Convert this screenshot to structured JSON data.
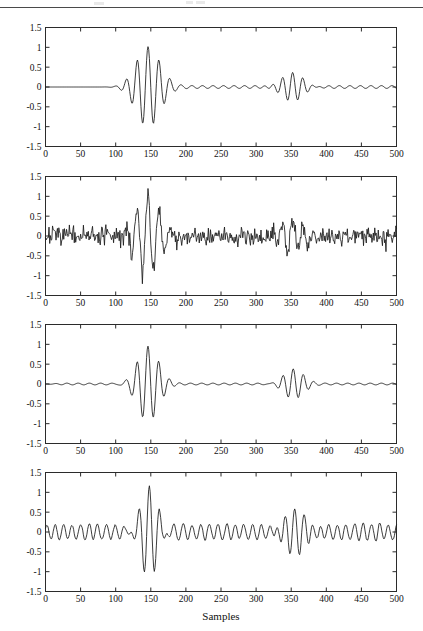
{
  "figure": {
    "background": "#ffffff",
    "line_color": "#1a1a1a",
    "axis_color": "#2b2b2b",
    "tick_font_size": 9.5,
    "label_font_size": 11
  },
  "axis": {
    "xlabel": "Samples",
    "xlim": [
      0,
      500
    ],
    "ylim": [
      -1.5,
      1.5
    ],
    "xticks": [
      0,
      50,
      100,
      150,
      200,
      250,
      300,
      350,
      400,
      450,
      500
    ],
    "xticklabels": [
      "0",
      "50",
      "100",
      "150",
      "200",
      "250",
      "300",
      "350",
      "400",
      "450",
      "500"
    ],
    "yticks": [
      1.5,
      1,
      0.5,
      0,
      -0.5,
      -1,
      -1.5
    ],
    "yticklabels": [
      "1.5",
      "1",
      "0.5",
      "0",
      "-0.5",
      "-1",
      "-1.5"
    ],
    "grid": false,
    "tick_direction": "in",
    "box": true
  },
  "chart_data": [
    {
      "type": "line",
      "title": "",
      "subplot_index": 1,
      "name": "original-clean-signal",
      "xlabel": "",
      "ylabel": "",
      "xlim": [
        0,
        500
      ],
      "ylim": [
        -1.5,
        1.5
      ],
      "xticks": [
        0,
        50,
        100,
        150,
        200,
        250,
        300,
        350,
        400,
        450,
        500
      ],
      "yticks": [
        -1.5,
        -1,
        -0.5,
        0,
        0.5,
        1,
        1.5
      ],
      "grid": false,
      "series": [
        {
          "name": "clean signal",
          "color": "#1a1a1a",
          "description": "Two Gaussian-modulated sinusoidal wave packets on a near-zero baseline with faint low-amplitude ripple between them.",
          "components": [
            {
              "kind": "gaussian-burst",
              "center": 146,
              "sigma": 17,
              "amplitude": 1.0,
              "period": 15.5,
              "phase": 0.0
            },
            {
              "kind": "gaussian-burst",
              "center": 352,
              "sigma": 16,
              "amplitude": 0.4,
              "period": 14.5,
              "phase": 0.0
            },
            {
              "kind": "ripple",
              "from": 100,
              "to": 500,
              "amplitude": 0.035,
              "period": 15.0
            }
          ],
          "peaks": [
            {
              "x": 117,
              "y": 0.3
            },
            {
              "x": 124,
              "y": -0.33
            },
            {
              "x": 131,
              "y": 0.82
            },
            {
              "x": 139,
              "y": -0.97
            },
            {
              "x": 146,
              "y": 1.0
            },
            {
              "x": 154,
              "y": -0.88
            },
            {
              "x": 161,
              "y": 0.7
            },
            {
              "x": 169,
              "y": -0.45
            },
            {
              "x": 177,
              "y": 0.22
            },
            {
              "x": 184,
              "y": -0.12
            },
            {
              "x": 331,
              "y": 0.28
            },
            {
              "x": 338,
              "y": -0.28
            },
            {
              "x": 345,
              "y": 0.33
            },
            {
              "x": 352,
              "y": -0.4
            },
            {
              "x": 359,
              "y": 0.38
            },
            {
              "x": 366,
              "y": -0.3
            },
            {
              "x": 374,
              "y": 0.18
            },
            {
              "x": 381,
              "y": -0.1
            }
          ]
        }
      ]
    },
    {
      "type": "line",
      "title": "",
      "subplot_index": 2,
      "name": "noisy-signal",
      "xlabel": "",
      "ylabel": "",
      "xlim": [
        0,
        500
      ],
      "ylim": [
        -1.5,
        1.5
      ],
      "xticks": [
        0,
        50,
        100,
        150,
        200,
        250,
        300,
        350,
        400,
        450,
        500
      ],
      "yticks": [
        -1.5,
        -1,
        -0.5,
        0,
        0.5,
        1,
        1.5
      ],
      "grid": false,
      "series": [
        {
          "name": "signal + white gaussian noise",
          "color": "#1a1a1a",
          "description": "Same signal buried in broadband white noise of roughly +/-0.3 amplitude across the whole record; main packet still visible at 120-175 reaching +/-1.1.",
          "components": [
            {
              "kind": "gaussian-burst",
              "center": 146,
              "sigma": 17,
              "amplitude": 1.0,
              "period": 15.5,
              "phase": 0.0
            },
            {
              "kind": "gaussian-burst",
              "center": 352,
              "sigma": 16,
              "amplitude": 0.4,
              "period": 14.5,
              "phase": 0.0
            },
            {
              "kind": "white-noise",
              "from": 0,
              "to": 500,
              "std": 0.2,
              "peak": 0.55,
              "seed": 7
            }
          ],
          "noise_std": 0.2,
          "max_value": 1.12,
          "min_value": -1.15
        }
      ]
    },
    {
      "type": "line",
      "title": "",
      "subplot_index": 3,
      "name": "denoised-signal-hard-threshold",
      "xlabel": "",
      "ylabel": "",
      "xlim": [
        0,
        500
      ],
      "ylim": [
        -1.5,
        1.5
      ],
      "xticks": [
        0,
        50,
        100,
        150,
        200,
        250,
        300,
        350,
        400,
        450,
        500
      ],
      "yticks": [
        -1.5,
        -1,
        -0.5,
        0,
        0.5,
        1,
        1.5
      ],
      "grid": false,
      "series": [
        {
          "name": "denoised signal",
          "color": "#1a1a1a",
          "description": "Reconstructed signal: noise almost fully suppressed to a flat baseline; both wave packets recovered with slight amplitude distortion and abrupt truncation near sample 180.",
          "components": [
            {
              "kind": "gaussian-burst",
              "center": 146,
              "sigma": 15,
              "amplitude": 0.95,
              "period": 15.5,
              "phase": 0.0
            },
            {
              "kind": "gaussian-burst",
              "center": 353,
              "sigma": 14,
              "amplitude": 0.37,
              "period": 14.5,
              "phase": 0.0
            },
            {
              "kind": "ripple",
              "from": 0,
              "to": 500,
              "amplitude": 0.022,
              "period": 16.0
            }
          ],
          "peaks": [
            {
              "x": 106,
              "y": 0.09
            },
            {
              "x": 120,
              "y": 0.26
            },
            {
              "x": 125,
              "y": -0.3
            },
            {
              "x": 132,
              "y": 0.9
            },
            {
              "x": 139,
              "y": -0.8
            },
            {
              "x": 146,
              "y": 0.93
            },
            {
              "x": 153,
              "y": -1.12
            },
            {
              "x": 161,
              "y": 0.64
            },
            {
              "x": 168,
              "y": -0.72
            },
            {
              "x": 175,
              "y": 0.4
            },
            {
              "x": 180,
              "y": -0.25
            },
            {
              "x": 334,
              "y": 0.27
            },
            {
              "x": 341,
              "y": -0.27
            },
            {
              "x": 348,
              "y": 0.24
            },
            {
              "x": 353,
              "y": -0.36
            },
            {
              "x": 360,
              "y": 0.36
            },
            {
              "x": 367,
              "y": -0.22
            },
            {
              "x": 372,
              "y": 0.27
            },
            {
              "x": 379,
              "y": -0.13
            }
          ]
        }
      ]
    },
    {
      "type": "line",
      "title": "",
      "subplot_index": 4,
      "name": "denoised-signal-residual-noise",
      "xlabel": "Samples",
      "ylabel": "",
      "xlim": [
        0,
        500
      ],
      "ylim": [
        -1.5,
        1.5
      ],
      "xticks": [
        0,
        50,
        100,
        150,
        200,
        250,
        300,
        350,
        400,
        450,
        500
      ],
      "yticks": [
        -1.5,
        -1,
        -0.5,
        0,
        0.5,
        1,
        1.5
      ],
      "grid": false,
      "series": [
        {
          "name": "denoised signal with residual oscillation",
          "color": "#1a1a1a",
          "description": "Alternative reconstruction: packets preserved but a persistent low-amplitude oscillatory residual (about +/-0.2) remains over the entire record.",
          "components": [
            {
              "kind": "gaussian-burst",
              "center": 148,
              "sigma": 15,
              "amplitude": 0.95,
              "period": 15.5,
              "phase": 0.0
            },
            {
              "kind": "gaussian-burst",
              "center": 355,
              "sigma": 18,
              "amplitude": 0.42,
              "period": 14.5,
              "phase": 0.0
            },
            {
              "kind": "residual-oscillation",
              "from": 0,
              "to": 500,
              "amplitude": 0.16,
              "period": 12.0,
              "seed": 19
            }
          ],
          "residual_amplitude": 0.18,
          "max_value": 0.95,
          "min_value": -1.1
        }
      ]
    }
  ]
}
